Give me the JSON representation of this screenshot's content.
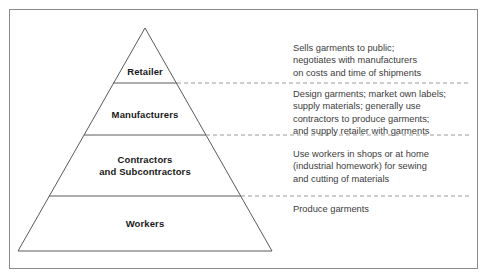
{
  "diagram": {
    "frame_color": "#8a8a8a",
    "line_color": "#5a5a5a",
    "dash_color": "#9a9a9a",
    "label_color": "#1a1a1a",
    "note_color": "#3c3c3c",
    "tiers": [
      {
        "id": "retailer",
        "label": "Retailer",
        "note": "Sells garments to public;\nnegotiates with manufacturers\non costs and time of shipments"
      },
      {
        "id": "manufacturers",
        "label": "Manufacturers",
        "note": "Design garments; market own labels;\nsupply materials; generally use\ncontractors to produce garments;\nand supply retailer with garments"
      },
      {
        "id": "contractors",
        "label": "Contractors\nand Subcontractors",
        "note": "Use workers in shops or at home\n(industrial homework) for sewing\nand cutting of materials"
      },
      {
        "id": "workers",
        "label": "Workers",
        "note": "Produce garments"
      }
    ]
  }
}
